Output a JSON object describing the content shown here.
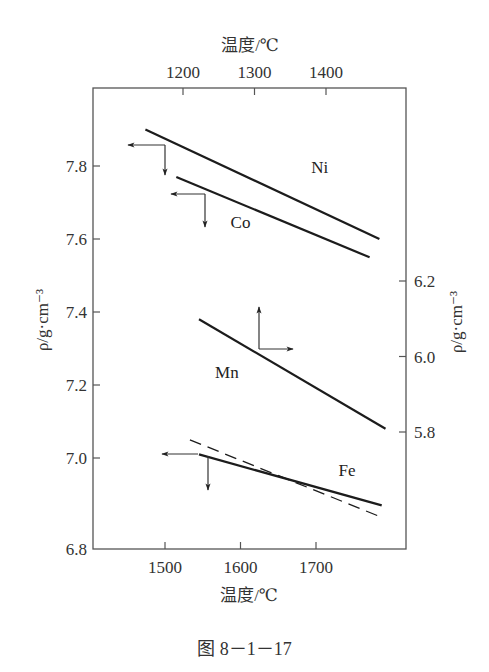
{
  "chart_data": {
    "type": "line",
    "caption": "图 8－1－17",
    "x_bottom": {
      "label": "温度/℃",
      "ticks": [
        1500,
        1600,
        1700
      ],
      "range": [
        1404,
        1819
      ]
    },
    "x_top": {
      "label": "温度/℃",
      "ticks": [
        1200,
        1300,
        1400
      ],
      "range": [
        1067,
        1279
      ]
    },
    "y_left": {
      "label": "ρ/g·cm⁻³",
      "ticks": [
        6.8,
        7.0,
        7.2,
        7.4,
        7.6,
        7.8
      ],
      "range": [
        6.78,
        8.02
      ]
    },
    "y_right": {
      "label": "ρ/g·cm⁻³",
      "ticks": [
        5.8,
        6.0,
        6.2
      ]
    },
    "series": [
      {
        "name": "Ni",
        "style": "solid",
        "axis": "bottom-left",
        "points": [
          [
            1474,
            7.9
          ],
          [
            1784,
            7.6
          ]
        ],
        "label_pos": [
          1705,
          7.78
        ]
      },
      {
        "name": "Co",
        "style": "solid",
        "axis": "bottom-left",
        "points": [
          [
            1515,
            7.77
          ],
          [
            1771,
            7.55
          ]
        ],
        "label_pos": [
          1600,
          7.63
        ]
      },
      {
        "name": "Mn",
        "style": "solid",
        "axis": "top-right",
        "points": [
          [
            1545,
            7.38
          ],
          [
            1792,
            7.08
          ]
        ],
        "label_pos": [
          1582,
          7.22
        ]
      },
      {
        "name": "Fe",
        "style": "solid",
        "axis": "bottom-left",
        "points": [
          [
            1545,
            7.01
          ],
          [
            1787,
            6.87
          ]
        ],
        "label_pos": [
          1741,
          6.95
        ]
      },
      {
        "name": "Fe (dashed)",
        "style": "dashed",
        "axis": "bottom-left",
        "points": [
          [
            1533,
            7.05
          ],
          [
            1784,
            6.84
          ]
        ]
      }
    ],
    "axis_indicators": [
      {
        "series": "Ni",
        "directions": [
          "left",
          "down"
        ]
      },
      {
        "series": "Co",
        "directions": [
          "left",
          "down"
        ]
      },
      {
        "series": "Mn",
        "directions": [
          "up",
          "right"
        ]
      },
      {
        "series": "Fe",
        "directions": [
          "left",
          "down"
        ]
      }
    ],
    "grid": false,
    "legend": "inline labels"
  }
}
